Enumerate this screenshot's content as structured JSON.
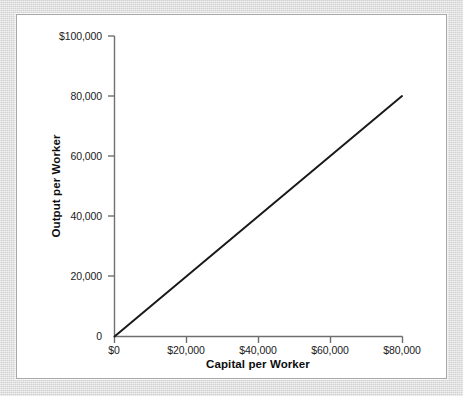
{
  "chart_data": {
    "type": "line",
    "title": "",
    "subtitle": "",
    "xlabel": "Capital per Worker",
    "ylabel": "Output per Worker",
    "xlim": [
      0,
      80000
    ],
    "ylim": [
      0,
      100000
    ],
    "grid": false,
    "legend": null,
    "x_tick_labels": [
      "$0",
      "$20,000",
      "$40,000",
      "$60,000",
      "$80,000"
    ],
    "x_tick_values": [
      0,
      20000,
      40000,
      60000,
      80000
    ],
    "y_tick_labels": [
      "0",
      "20,000",
      "40,000",
      "60,000",
      "80,000",
      "$100,000"
    ],
    "y_tick_values": [
      0,
      20000,
      40000,
      60000,
      80000,
      100000
    ],
    "series": [
      {
        "name": "Production function",
        "x": [
          0,
          80000
        ],
        "values": [
          0,
          80000
        ]
      }
    ],
    "annotations": []
  },
  "axes": {
    "x_title": "Capital per Worker",
    "y_title": "Output per Worker",
    "x_ticks": [
      {
        "label": "$0"
      },
      {
        "label": "$20,000"
      },
      {
        "label": "$40,000"
      },
      {
        "label": "$60,000"
      },
      {
        "label": "$80,000"
      }
    ],
    "y_ticks": [
      {
        "label": "$100,000"
      },
      {
        "label": "80,000"
      },
      {
        "label": "60,000"
      },
      {
        "label": "40,000"
      },
      {
        "label": "20,000"
      },
      {
        "label": "0"
      }
    ]
  },
  "colors": {
    "background": "#d9d9d9",
    "panel": "#ffffff",
    "axis": "#6f6f6f",
    "data_line": "#1a1a1a",
    "text": "#1a1a1a"
  }
}
